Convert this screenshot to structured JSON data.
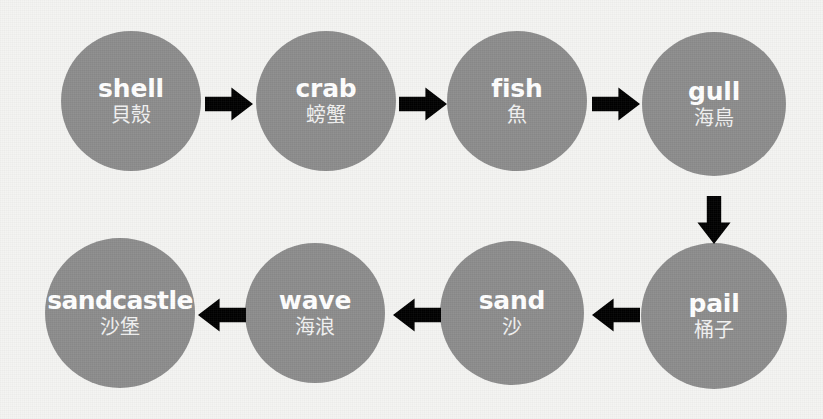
{
  "diagram": {
    "type": "flowchart",
    "layout": "snake",
    "background_color": "#f4f4f2",
    "node_color": "#8c8c8c",
    "node_text_color": "#ffffff",
    "arrow_color": "#000000",
    "nodes": [
      {
        "id": "shell",
        "en": "shell",
        "zh": "貝殼",
        "row": "top",
        "order": 1,
        "cx": 131,
        "cy": 101,
        "r": 70
      },
      {
        "id": "crab",
        "en": "crab",
        "zh": "螃蟹",
        "row": "top",
        "order": 2,
        "cx": 326,
        "cy": 101,
        "r": 70
      },
      {
        "id": "fish",
        "en": "fish",
        "zh": "魚",
        "row": "top",
        "order": 3,
        "cx": 517,
        "cy": 101,
        "r": 70
      },
      {
        "id": "gull",
        "en": "gull",
        "zh": "海鳥",
        "row": "top",
        "order": 4,
        "cx": 714,
        "cy": 104,
        "r": 72
      },
      {
        "id": "pail",
        "en": "pail",
        "zh": "桶子",
        "row": "bottom",
        "order": 5,
        "cx": 714,
        "cy": 316,
        "r": 73
      },
      {
        "id": "sand",
        "en": "sand",
        "zh": "沙",
        "row": "bottom",
        "order": 6,
        "cx": 512,
        "cy": 313,
        "r": 72
      },
      {
        "id": "wave",
        "en": "wave",
        "zh": "海浪",
        "row": "bottom",
        "order": 7,
        "cx": 315,
        "cy": 313,
        "r": 70
      },
      {
        "id": "sandcastle",
        "en": "sandcastle",
        "zh": "沙堡",
        "row": "bottom",
        "order": 8,
        "cx": 120,
        "cy": 313,
        "r": 75
      }
    ],
    "arrows": [
      {
        "id": "shell-to-crab",
        "from": "shell",
        "to": "crab",
        "direction": "right",
        "x": 205,
        "y": 86,
        "w": 48,
        "h": 36
      },
      {
        "id": "crab-to-fish",
        "from": "crab",
        "to": "fish",
        "direction": "right",
        "x": 399,
        "y": 86,
        "w": 48,
        "h": 36
      },
      {
        "id": "fish-to-gull",
        "from": "fish",
        "to": "gull",
        "direction": "right",
        "x": 592,
        "y": 86,
        "w": 48,
        "h": 36
      },
      {
        "id": "gull-to-pail",
        "from": "gull",
        "to": "pail",
        "direction": "down",
        "x": 696,
        "y": 196,
        "w": 36,
        "h": 48
      },
      {
        "id": "pail-to-sand",
        "from": "pail",
        "to": "sand",
        "direction": "left",
        "x": 592,
        "y": 297,
        "w": 48,
        "h": 36
      },
      {
        "id": "sand-to-wave",
        "from": "sand",
        "to": "wave",
        "direction": "left",
        "x": 393,
        "y": 297,
        "w": 48,
        "h": 36
      },
      {
        "id": "wave-to-sandcastle",
        "from": "wave",
        "to": "sandcastle",
        "direction": "left",
        "x": 198,
        "y": 297,
        "w": 48,
        "h": 36
      }
    ]
  }
}
